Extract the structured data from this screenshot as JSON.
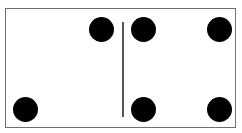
{
  "domino": {
    "left_half": {
      "value": 2,
      "pips": [
        {
          "x": 101,
          "y": 29
        },
        {
          "x": 25,
          "y": 109
        }
      ]
    },
    "right_half": {
      "value": 4,
      "pips": [
        {
          "x": 143,
          "y": 29
        },
        {
          "x": 219,
          "y": 29
        },
        {
          "x": 143,
          "y": 109
        },
        {
          "x": 219,
          "y": 109
        }
      ]
    },
    "colors": {
      "border": "#707070",
      "pip": "#000000",
      "background": "#ffffff"
    }
  }
}
